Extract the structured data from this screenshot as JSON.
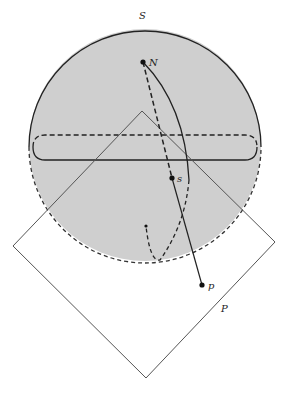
{
  "diagram": {
    "colors": {
      "sphere_fill": "#cfcfcf",
      "stroke": "#222222",
      "plane_stroke": "#555555",
      "background": "#ffffff"
    },
    "labels": {
      "sphere": "S",
      "north_pole": "N",
      "sphere_point": "s",
      "plane_point": "p",
      "plane": "P"
    },
    "points": {
      "N": {
        "x": 143,
        "y": 62
      },
      "s": {
        "x": 172,
        "y": 178
      },
      "p": {
        "x": 202,
        "y": 285
      },
      "lower": {
        "x": 146,
        "y": 226
      }
    },
    "sphere": {
      "cx": 145,
      "cy": 145,
      "r": 116
    },
    "plane_corners": [
      {
        "x": 142,
        "y": 111
      },
      {
        "x": 275,
        "y": 242
      },
      {
        "x": 146,
        "y": 378
      },
      {
        "x": 13,
        "y": 246
      }
    ]
  }
}
